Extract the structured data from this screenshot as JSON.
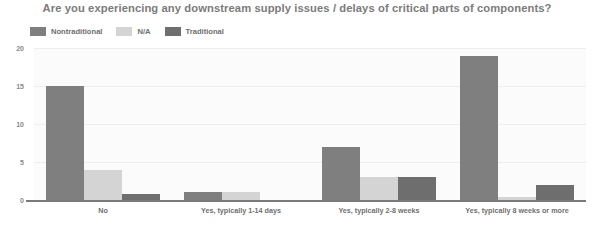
{
  "chart_data": {
    "type": "bar",
    "title": "Are you experiencing any downstream supply issues / delays of critical parts of components?",
    "xlabel": "",
    "ylabel": "",
    "ylim": [
      0,
      20
    ],
    "yticks": [
      "0",
      "5",
      "10",
      "15",
      "20"
    ],
    "grid": true,
    "legend_position": "top-left",
    "categories": [
      "No",
      "Yes, typically 1-14 days",
      "Yes, typically 2-8 weeks",
      "Yes, typically 8 weeks or more"
    ],
    "series": [
      {
        "name": "Nontraditional",
        "color": "#7f7f7f",
        "values": [
          15,
          1,
          7,
          19
        ]
      },
      {
        "name": "N/A",
        "color": "#d4d4d4",
        "values": [
          4,
          1,
          3,
          0.4
        ]
      },
      {
        "name": "Traditional",
        "color": "#6e6e6e",
        "values": [
          0.8,
          0,
          3,
          2
        ]
      }
    ]
  },
  "colors": {
    "plot_background": "#fbfbfb",
    "gridline": "#ededed",
    "axis": "#7a7a7a",
    "title_text": "#7b7b7b",
    "label_text": "#6f6f6f"
  }
}
